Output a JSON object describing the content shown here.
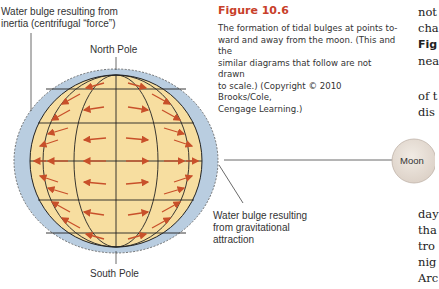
{
  "figure": {
    "title": "Figure 10.6",
    "caption": "The formation of tidal bulges at points toward and away from the moon. (This and the similar diagrams that follow are not drawn to scale.) (Copyright © 2010 Brooks/Cole, Cengage Learning.)",
    "caption_lines": [
      "The formation of tidal bulges at points to-",
      "ward and away from the moon. (This and the",
      "similar diagrams that follow are not drawn",
      "to scale.) (Copyright © 2010 Brooks/Cole,",
      "Cengage Learning.)"
    ],
    "labels": {
      "inertia_bulge_line1": "Water bulge resulting from",
      "inertia_bulge_line2": "inertia (centrifugal “force”)",
      "north_pole": "North Pole",
      "south_pole": "South Pole",
      "gravity_bulge_line1": "Water bulge resulting",
      "gravity_bulge_line2": "from gravitational",
      "gravity_bulge_line3": "attraction",
      "moon": "Moon"
    },
    "colors": {
      "earth": "#f7deA0",
      "water": "#b9cde0",
      "arrows": "#c8502a",
      "title": "#c8402a"
    }
  },
  "body_text": {
    "top_fragments": [
      "not",
      "cha",
      "Fig",
      "nea"
    ],
    "mid_fragments": [
      "of t",
      "dis"
    ],
    "bottom_fragments": [
      "day",
      "tha",
      "tro",
      "nig",
      "Arc"
    ]
  }
}
